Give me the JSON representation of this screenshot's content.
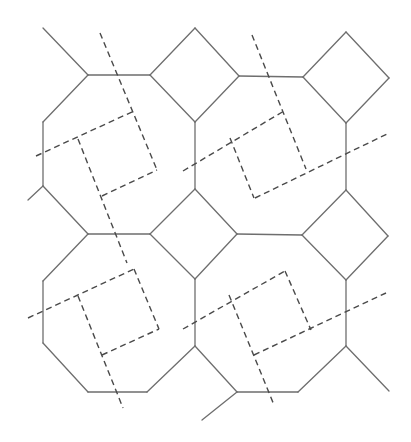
{
  "diagram": {
    "colors": {
      "background": "#ffffff",
      "solid_stroke": "#6e6e6e",
      "dashed_stroke": "#4a4a4a"
    },
    "solid_segments": [
      [
        43,
        28,
        88,
        75
      ],
      [
        88,
        75,
        150,
        75
      ],
      [
        150,
        75,
        195,
        28
      ],
      [
        195,
        28,
        239,
        76
      ],
      [
        239,
        76,
        195,
        122
      ],
      [
        195,
        122,
        150,
        75
      ],
      [
        239,
        76,
        303,
        77
      ],
      [
        303,
        77,
        346,
        32
      ],
      [
        346,
        32,
        389,
        78
      ],
      [
        389,
        78,
        346,
        123
      ],
      [
        346,
        123,
        303,
        77
      ],
      [
        88,
        75,
        43,
        122
      ],
      [
        43,
        122,
        43,
        186
      ],
      [
        43,
        186,
        28,
        200
      ],
      [
        43,
        186,
        88,
        234
      ],
      [
        195,
        122,
        195,
        189
      ],
      [
        346,
        123,
        346,
        190
      ],
      [
        88,
        234,
        150,
        234
      ],
      [
        150,
        234,
        195,
        189
      ],
      [
        195,
        189,
        237,
        234
      ],
      [
        237,
        234,
        195,
        279
      ],
      [
        195,
        279,
        150,
        234
      ],
      [
        237,
        234,
        302,
        235
      ],
      [
        302,
        235,
        346,
        190
      ],
      [
        346,
        190,
        388,
        236
      ],
      [
        388,
        236,
        346,
        280
      ],
      [
        346,
        280,
        302,
        235
      ],
      [
        88,
        234,
        43,
        281
      ],
      [
        43,
        281,
        43,
        343
      ],
      [
        43,
        343,
        88,
        392
      ],
      [
        88,
        392,
        147,
        392
      ],
      [
        147,
        392,
        195,
        346
      ],
      [
        195,
        346,
        195,
        279
      ],
      [
        195,
        346,
        237,
        392
      ],
      [
        237,
        392,
        298,
        392
      ],
      [
        298,
        392,
        346,
        346
      ],
      [
        346,
        346,
        346,
        280
      ],
      [
        346,
        346,
        389,
        391
      ],
      [
        237,
        392,
        202,
        420
      ]
    ],
    "dashed_segments": [
      [
        100,
        33,
        157,
        170
      ],
      [
        36,
        156,
        134,
        111
      ],
      [
        78,
        139,
        127,
        263
      ],
      [
        102,
        196,
        157,
        170
      ],
      [
        252,
        35,
        306,
        169
      ],
      [
        183,
        171,
        284,
        111
      ],
      [
        230,
        138,
        254,
        198
      ],
      [
        255,
        198,
        389,
        133
      ],
      [
        28,
        318,
        134,
        269
      ],
      [
        78,
        296,
        123,
        408
      ],
      [
        102,
        355,
        159,
        329
      ],
      [
        134,
        269,
        159,
        329
      ],
      [
        183,
        329,
        285,
        271
      ],
      [
        229,
        295,
        274,
        405
      ],
      [
        254,
        355,
        386,
        293
      ],
      [
        285,
        271,
        311,
        330
      ]
    ]
  }
}
